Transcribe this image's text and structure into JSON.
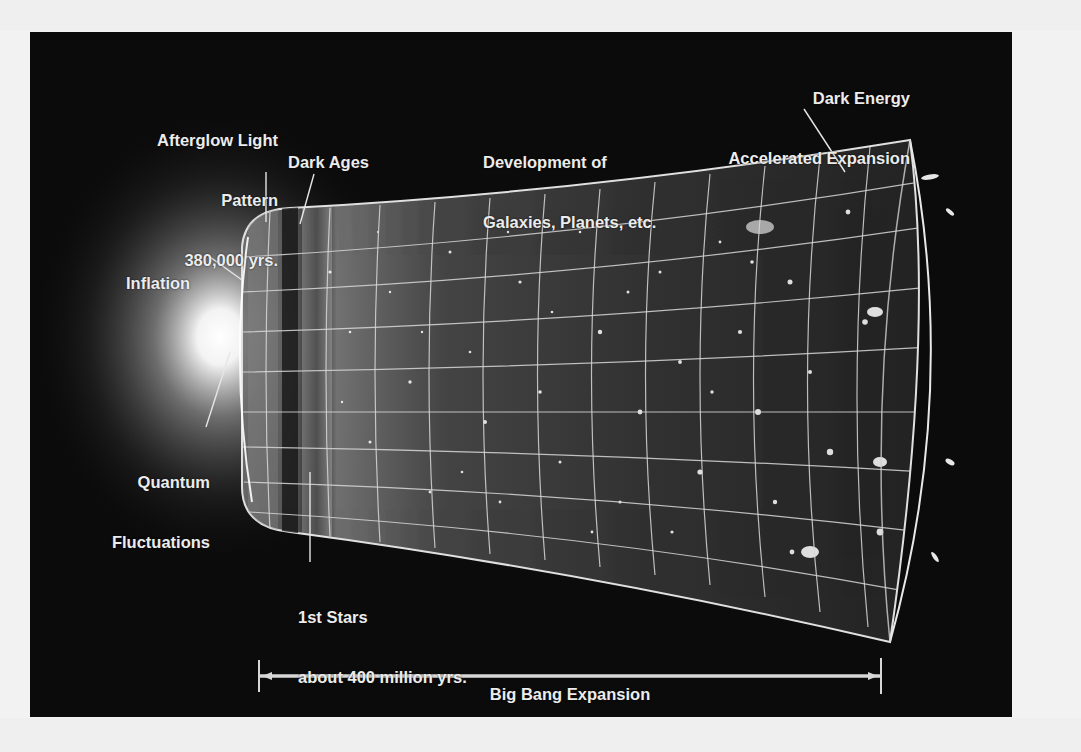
{
  "diagram": {
    "labels": {
      "afterglow": {
        "line1": "Afterglow Light",
        "line2": "Pattern",
        "line3": "380,000 yrs."
      },
      "dark_ages": {
        "line1": "Dark Ages"
      },
      "development": {
        "line1": "Development of",
        "line2": "Galaxies, Planets, etc."
      },
      "dark_energy": {
        "line1": "Dark Energy",
        "line2": "Accelerated Expansion"
      },
      "inflation": {
        "line1": "Inflation"
      },
      "quantum": {
        "line1": "Quantum",
        "line2": "Fluctuations"
      },
      "first_stars": {
        "line1": "1st Stars",
        "line2": "about 400 million yrs."
      }
    },
    "timeline": {
      "label_top": "Big Bang Expansion",
      "label_bottom": "13.7 billion years"
    },
    "colors": {
      "background": "#0b0b0b",
      "text": "#ececec",
      "grid": "#d8d8d8",
      "page": "#f2f2f2"
    }
  }
}
